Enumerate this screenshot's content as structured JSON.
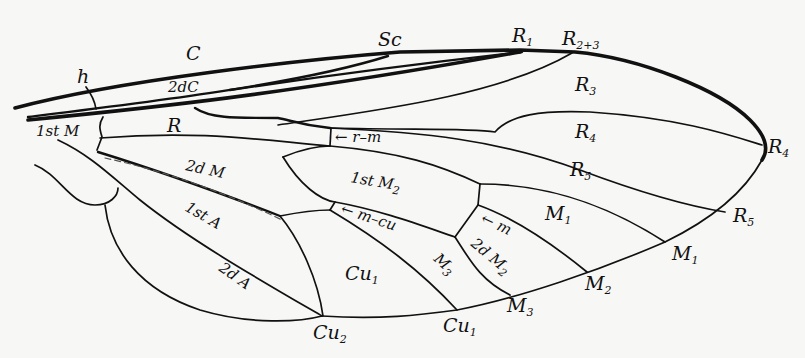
{
  "figure": {
    "colors": {
      "background": "#f7f7f5",
      "ink": "#111111"
    }
  },
  "labels": {
    "h": "h",
    "C": "C",
    "Sc": "Sc",
    "R1_main": "R",
    "R1_sub": "1",
    "R23_main": "R",
    "R23_sub": "2+3",
    "dC": "2dC",
    "firstM": "1st M",
    "R": "R",
    "R3_main": "R",
    "R3_sub": "3",
    "R4_main": "R",
    "R4_sub": "4",
    "R4edge_main": "R",
    "R4edge_sub": "4",
    "rm": "← r–m",
    "secondM": "2d M",
    "firstM2_main": "1st M",
    "firstM2_sub": "2",
    "R5_main": "R",
    "R5_sub": "5",
    "R5edge_main": "R",
    "R5edge_sub": "5",
    "M1cell_main": "M",
    "M1cell_sub": "1",
    "mcu": "← m–cu",
    "m": "← m",
    "firstA": "1st A",
    "secondM2_main": "2d M",
    "secondM2_sub": "2",
    "M3cell_main": "M",
    "M3cell_sub": "3",
    "M1edge_main": "M",
    "M1edge_sub": "1",
    "M2edge_main": "M",
    "M2edge_sub": "2",
    "secondA": "2d A",
    "Cu1cell_main": "Cu",
    "Cu1cell_sub": "1",
    "M3edge_main": "M",
    "M3edge_sub": "3",
    "Cu1edge_main": "Cu",
    "Cu1edge_sub": "1",
    "Cu2_main": "Cu",
    "Cu2_sub": "2"
  }
}
